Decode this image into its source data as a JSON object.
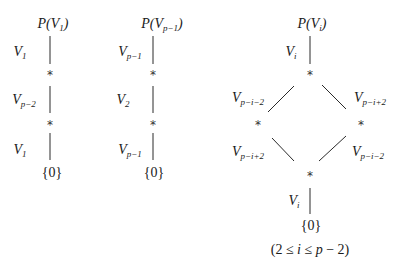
{
  "diagram": {
    "type": "subgroup-lattice",
    "diagrams": [
      {
        "id": "left",
        "top": {
          "base": "P(V",
          "sub": "1",
          "close": ")"
        },
        "edges": [
          {
            "label_base": "V",
            "label_sub": "1"
          },
          {
            "label_base": "V",
            "label_sub": "p−2"
          },
          {
            "label_base": "V",
            "label_sub": "1"
          }
        ],
        "intermediate_nodes": [
          "*",
          "*"
        ],
        "bottom": "{0}"
      },
      {
        "id": "middle",
        "top": {
          "base": "P(V",
          "sub": "p−1",
          "close": ")"
        },
        "edges": [
          {
            "label_base": "V",
            "label_sub": "p−1"
          },
          {
            "label_base": "V",
            "label_sub": "2"
          },
          {
            "label_base": "V",
            "label_sub": "p−1"
          }
        ],
        "intermediate_nodes": [
          "*",
          "*"
        ],
        "bottom": "{0}"
      },
      {
        "id": "right",
        "top": {
          "base": "P(V",
          "sub": "i",
          "close": ")"
        },
        "edges": {
          "top": {
            "label_base": "V",
            "label_sub": "i"
          },
          "upper_left": {
            "label_base": "V",
            "label_sub": "p−i−2"
          },
          "upper_right": {
            "label_base": "V",
            "label_sub": "p−i+2"
          },
          "lower_left": {
            "label_base": "V",
            "label_sub": "p−i+2"
          },
          "lower_right": {
            "label_base": "V",
            "label_sub": "p−i−2"
          },
          "bottom": {
            "label_base": "V",
            "label_sub": "i"
          }
        },
        "intermediate_nodes": [
          "*",
          "*",
          "*",
          "*"
        ],
        "bottom": "{0}",
        "condition": {
          "open": "(2 ≤ ",
          "var": "i",
          "mid": " ≤ ",
          "var2": "p",
          "close": " − 2)"
        }
      }
    ]
  }
}
